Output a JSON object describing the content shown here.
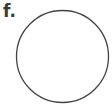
{
  "panel": {
    "label": "f."
  },
  "shape": {
    "type": "circle",
    "cx": 62.5,
    "cy": 56.5,
    "r": 46,
    "stroke": "#444444",
    "stroke_width": 1.3,
    "fill": "none"
  }
}
